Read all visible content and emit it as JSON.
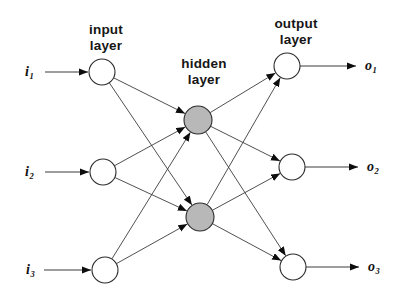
{
  "colors": {
    "background": "#ffffff",
    "node_stroke": "#2b2b2b",
    "input_output_fill": "#ffffff",
    "hidden_fill": "#b8b8b8",
    "edge": "#3c3c3c",
    "arrowhead": "#0d0d0d",
    "text": "#161616"
  },
  "labels": {
    "input": {
      "line1": "input",
      "line2": "layer"
    },
    "hidden": {
      "line1": "hidden",
      "line2": "layer"
    },
    "output": {
      "line1": "output",
      "line2": "layer"
    }
  },
  "io": {
    "i1": {
      "base": "i",
      "sub": "1"
    },
    "i2": {
      "base": "i",
      "sub": "2"
    },
    "i3": {
      "base": "i",
      "sub": "3"
    },
    "o1": {
      "base": "o",
      "sub": "1"
    },
    "o2": {
      "base": "o",
      "sub": "2"
    },
    "o3": {
      "base": "o",
      "sub": "3"
    }
  },
  "network": {
    "nodes": [
      {
        "id": "i1",
        "layer": "input",
        "x": 102,
        "y": 72,
        "r": 13,
        "fill": "input_output_fill"
      },
      {
        "id": "i2",
        "layer": "input",
        "x": 103,
        "y": 172,
        "r": 13,
        "fill": "input_output_fill"
      },
      {
        "id": "i3",
        "layer": "input",
        "x": 105,
        "y": 270,
        "r": 13,
        "fill": "input_output_fill"
      },
      {
        "id": "h1",
        "layer": "hidden",
        "x": 198,
        "y": 120,
        "r": 14,
        "fill": "hidden_fill"
      },
      {
        "id": "h2",
        "layer": "hidden",
        "x": 200,
        "y": 217,
        "r": 14,
        "fill": "hidden_fill"
      },
      {
        "id": "o1",
        "layer": "output",
        "x": 287,
        "y": 66,
        "r": 13,
        "fill": "input_output_fill"
      },
      {
        "id": "o2",
        "layer": "output",
        "x": 292,
        "y": 167,
        "r": 13,
        "fill": "input_output_fill"
      },
      {
        "id": "o3",
        "layer": "output",
        "x": 293,
        "y": 267,
        "r": 13,
        "fill": "input_output_fill"
      }
    ],
    "edges": [
      {
        "from": "i1",
        "to": "h1"
      },
      {
        "from": "i1",
        "to": "h2"
      },
      {
        "from": "i2",
        "to": "h1"
      },
      {
        "from": "i2",
        "to": "h2"
      },
      {
        "from": "i3",
        "to": "h1"
      },
      {
        "from": "i3",
        "to": "h2"
      },
      {
        "from": "h1",
        "to": "o1"
      },
      {
        "from": "h1",
        "to": "o2"
      },
      {
        "from": "h1",
        "to": "o3"
      },
      {
        "from": "h2",
        "to": "o1"
      },
      {
        "from": "h2",
        "to": "o2"
      },
      {
        "from": "h2",
        "to": "o3"
      }
    ],
    "external_arrows": [
      {
        "id": "input-arrow-i1",
        "x1": 45,
        "y1": 72,
        "x2": 88,
        "y2": 72
      },
      {
        "id": "input-arrow-i2",
        "x1": 45,
        "y1": 172,
        "x2": 89,
        "y2": 172
      },
      {
        "id": "input-arrow-i3",
        "x1": 44,
        "y1": 270,
        "x2": 91,
        "y2": 270
      },
      {
        "id": "output-arrow-o1",
        "x1": 300,
        "y1": 66,
        "x2": 356,
        "y2": 66
      },
      {
        "id": "output-arrow-o2",
        "x1": 305,
        "y1": 167,
        "x2": 358,
        "y2": 167
      },
      {
        "id": "output-arrow-o3",
        "x1": 306,
        "y1": 267,
        "x2": 359,
        "y2": 267
      }
    ]
  }
}
